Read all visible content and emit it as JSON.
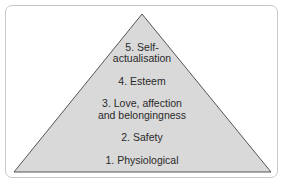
{
  "diagram": {
    "type": "pyramid",
    "levels": [
      {
        "label_line1": "5. Self-",
        "label_line2": "actualisation"
      },
      {
        "label_line1": "4. Esteem"
      },
      {
        "label_line1": "3. Love, affection",
        "label_line2": "and belongingness"
      },
      {
        "label_line1": "2. Safety"
      },
      {
        "label_line1": "1. Physiological"
      }
    ],
    "colors": {
      "fill": "#d9d9d9",
      "stroke": "#555555",
      "frame": "#c8c8c8"
    }
  }
}
